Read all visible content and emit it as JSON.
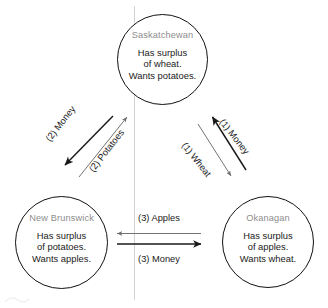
{
  "diagram": {
    "type": "trade-cycle-diagram",
    "colors": {
      "node_border": "#111111",
      "node_title": "#8d8d8d",
      "body_text": "#1a1a1a",
      "arrow_thick": "#1a1a1a",
      "arrow_thin": "#6b6b6b",
      "guide_line": "#cfcfcf",
      "background": "#ffffff"
    },
    "nodes": [
      {
        "id": "saskatchewan",
        "title": "Saskatchewan",
        "lines": [
          "Has surplus",
          "of wheat.",
          "Wants potatoes."
        ]
      },
      {
        "id": "new-brunswick",
        "title": "New Brunswick",
        "lines": [
          "Has surplus",
          "of potatoes.",
          "Wants apples."
        ]
      },
      {
        "id": "okanagan",
        "title": "Okanagan",
        "lines": [
          "Has surplus",
          "of apples.",
          "Wants wheat."
        ]
      }
    ],
    "edges": [
      {
        "id": "okanagan-to-saskatchewan-money",
        "label": "(1) Money",
        "from": "okanagan",
        "to": "saskatchewan",
        "weight": "thick"
      },
      {
        "id": "saskatchewan-to-okanagan-wheat",
        "label": "(1) Wheat",
        "from": "saskatchewan",
        "to": "okanagan",
        "weight": "thin"
      },
      {
        "id": "saskatchewan-to-new-brunswick-money",
        "label": "(2) Money",
        "from": "saskatchewan",
        "to": "new-brunswick",
        "weight": "thick"
      },
      {
        "id": "new-brunswick-to-saskatchewan-potatoes",
        "label": "(2) Potatoes",
        "from": "new-brunswick",
        "to": "saskatchewan",
        "weight": "thin"
      },
      {
        "id": "okanagan-to-new-brunswick-apples",
        "label": "(3) Apples",
        "from": "okanagan",
        "to": "new-brunswick",
        "weight": "thin"
      },
      {
        "id": "new-brunswick-to-okanagan-money",
        "label": "(3) Money",
        "from": "new-brunswick",
        "to": "okanagan",
        "weight": "thick"
      }
    ]
  }
}
